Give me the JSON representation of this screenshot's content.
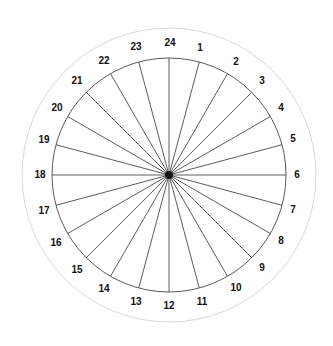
{
  "diagram": {
    "background_color": "#ffffff",
    "center": {
      "x": 169,
      "y": 175
    },
    "hub": {
      "icon": "center-hub-dot",
      "radius": 4,
      "color": "#151515"
    },
    "inner_circle": {
      "radius": 117,
      "stroke_color": "#5a5a5a",
      "stroke_width": 1
    },
    "outer_circle": {
      "radius": 147,
      "stroke_color": "#d8d8d8",
      "stroke_width": 1
    },
    "spokes": {
      "count": 24,
      "angle_step_degrees": 15,
      "stroke_color": "#4a4a4a",
      "stroke_width": 0.9
    },
    "label_style": {
      "color": "#111111",
      "font_size_px": 10,
      "bold": true,
      "radius": 132
    },
    "ticks": [
      {
        "label": "1",
        "angle_deg": 15,
        "lx": 200,
        "ly": 48
      },
      {
        "label": "2",
        "angle_deg": 30,
        "lx": 236,
        "ly": 62
      },
      {
        "label": "3",
        "angle_deg": 45,
        "lx": 262,
        "ly": 81
      },
      {
        "label": "4",
        "angle_deg": 60,
        "lx": 281,
        "ly": 108
      },
      {
        "label": "5",
        "angle_deg": 75,
        "lx": 293,
        "ly": 139
      },
      {
        "label": "6",
        "angle_deg": 90,
        "lx": 297,
        "ly": 175
      },
      {
        "label": "7",
        "angle_deg": 105,
        "lx": 293,
        "ly": 210
      },
      {
        "label": "8",
        "angle_deg": 120,
        "lx": 281,
        "ly": 241
      },
      {
        "label": "9",
        "angle_deg": 135,
        "lx": 262,
        "ly": 268
      },
      {
        "label": "10",
        "angle_deg": 150,
        "lx": 236,
        "ly": 288
      },
      {
        "label": "11",
        "angle_deg": 165,
        "lx": 202,
        "ly": 302
      },
      {
        "label": "12",
        "angle_deg": 180,
        "lx": 169,
        "ly": 306
      },
      {
        "label": "13",
        "angle_deg": 195,
        "lx": 136,
        "ly": 302
      },
      {
        "label": "14",
        "angle_deg": 210,
        "lx": 104,
        "ly": 289
      },
      {
        "label": "15",
        "angle_deg": 225,
        "lx": 77,
        "ly": 270
      },
      {
        "label": "16",
        "angle_deg": 240,
        "lx": 56,
        "ly": 243
      },
      {
        "label": "17",
        "angle_deg": 255,
        "lx": 44,
        "ly": 211
      },
      {
        "label": "18",
        "angle_deg": 270,
        "lx": 40,
        "ly": 175
      },
      {
        "label": "19",
        "angle_deg": 285,
        "lx": 44,
        "ly": 140
      },
      {
        "label": "20",
        "angle_deg": 300,
        "lx": 57,
        "ly": 108
      },
      {
        "label": "21",
        "angle_deg": 315,
        "lx": 77,
        "ly": 81
      },
      {
        "label": "22",
        "angle_deg": 330,
        "lx": 104,
        "ly": 61
      },
      {
        "label": "23",
        "angle_deg": 345,
        "lx": 136,
        "ly": 47
      },
      {
        "label": "24",
        "angle_deg": 0,
        "lx": 170,
        "ly": 43
      }
    ]
  },
  "chart_data": {
    "type": "pie",
    "categories": [
      "1",
      "2",
      "3",
      "4",
      "5",
      "6",
      "7",
      "8",
      "9",
      "10",
      "11",
      "12",
      "13",
      "14",
      "15",
      "16",
      "17",
      "18",
      "19",
      "20",
      "21",
      "22",
      "23",
      "24"
    ],
    "values": [
      15,
      15,
      15,
      15,
      15,
      15,
      15,
      15,
      15,
      15,
      15,
      15,
      15,
      15,
      15,
      15,
      15,
      15,
      15,
      15,
      15,
      15,
      15,
      15
    ],
    "xlabel": "",
    "ylabel": "",
    "legend_position": "none",
    "grid": false
  }
}
